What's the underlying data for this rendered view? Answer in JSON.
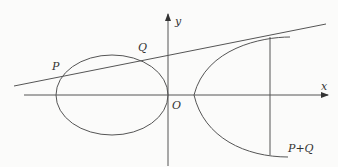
{
  "diagram": {
    "labels": {
      "x_axis": "x",
      "y_axis": "y",
      "origin": "O",
      "point_p": "P",
      "point_q": "Q",
      "point_sum": "P+Q"
    },
    "colors": {
      "background": "#fbfbfa",
      "stroke": "#555555",
      "text": "#333333"
    }
  }
}
